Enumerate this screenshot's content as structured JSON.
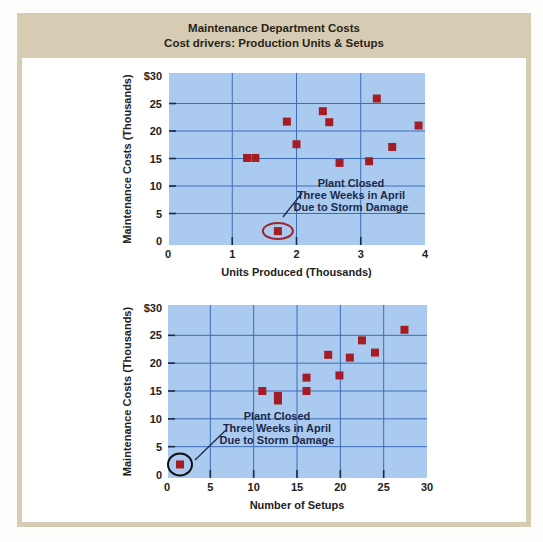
{
  "header": {
    "title": "Maintenance Department Costs",
    "subtitle": "Cost drivers: Production Units & Setups"
  },
  "colors": {
    "frame": "#d6ccb4",
    "plot_background": "#aacbef",
    "gridline": "#3d6cb8",
    "marker": "#a51d24",
    "top_annotation_ellipse": "#a0232b",
    "bottom_annotation_ellipse": "#111111"
  },
  "chart_data": [
    {
      "type": "scatter",
      "title": "",
      "xlabel": "Units Produced (Thousands)",
      "ylabel": "Maintenance Costs (Thousands)",
      "xlim": [
        0,
        4
      ],
      "ylim": [
        0,
        30
      ],
      "xticks": [
        "0",
        "1",
        "2",
        "3",
        "4"
      ],
      "xtick_values": [
        0,
        1,
        2,
        3,
        4
      ],
      "yticks": [
        "0",
        "5",
        "10",
        "15",
        "20",
        "25",
        "$30"
      ],
      "ytick_values": [
        0,
        5,
        10,
        15,
        20,
        25,
        30
      ],
      "grid": true,
      "points": [
        {
          "x": 1.23,
          "y": 15.1
        },
        {
          "x": 1.36,
          "y": 15.1
        },
        {
          "x": 1.85,
          "y": 21.7
        },
        {
          "x": 2.0,
          "y": 17.6
        },
        {
          "x": 2.41,
          "y": 23.6
        },
        {
          "x": 2.51,
          "y": 21.6
        },
        {
          "x": 2.67,
          "y": 14.2
        },
        {
          "x": 3.13,
          "y": 14.5
        },
        {
          "x": 3.25,
          "y": 25.9
        },
        {
          "x": 3.49,
          "y": 17.1
        },
        {
          "x": 3.9,
          "y": 21.0
        },
        {
          "x": 1.71,
          "y": 1.8
        }
      ],
      "annotation": {
        "lines": [
          "Plant Closed",
          "Three Weeks in April",
          "Due to Storm Damage"
        ],
        "target": {
          "x": 1.71,
          "y": 1.8
        }
      }
    },
    {
      "type": "scatter",
      "title": "",
      "xlabel": "Number of Setups",
      "ylabel": "Maintenance Costs (Thousands)",
      "xlim": [
        0,
        30
      ],
      "ylim": [
        0,
        30
      ],
      "xticks": [
        "0",
        "5",
        "10",
        "15",
        "20",
        "25",
        "30"
      ],
      "xtick_values": [
        0,
        5,
        10,
        15,
        20,
        25,
        30
      ],
      "yticks": [
        "0",
        "5",
        "10",
        "15",
        "20",
        "25",
        "$30"
      ],
      "ytick_values": [
        0,
        5,
        10,
        15,
        20,
        25,
        30
      ],
      "grid": true,
      "points": [
        {
          "x": 1.5,
          "y": 1.8
        },
        {
          "x": 11.0,
          "y": 15.0
        },
        {
          "x": 12.8,
          "y": 14.1
        },
        {
          "x": 12.8,
          "y": 13.3
        },
        {
          "x": 16.1,
          "y": 17.4
        },
        {
          "x": 16.1,
          "y": 15.0
        },
        {
          "x": 18.6,
          "y": 21.5
        },
        {
          "x": 19.9,
          "y": 17.8
        },
        {
          "x": 21.1,
          "y": 21.0
        },
        {
          "x": 22.5,
          "y": 24.1
        },
        {
          "x": 24.0,
          "y": 21.9
        },
        {
          "x": 27.4,
          "y": 26.0
        }
      ],
      "annotation": {
        "lines": [
          "Plant Closed",
          "Three Weeks in April",
          "Due to Storm Damage"
        ],
        "target": {
          "x": 1.5,
          "y": 1.8
        }
      }
    }
  ]
}
